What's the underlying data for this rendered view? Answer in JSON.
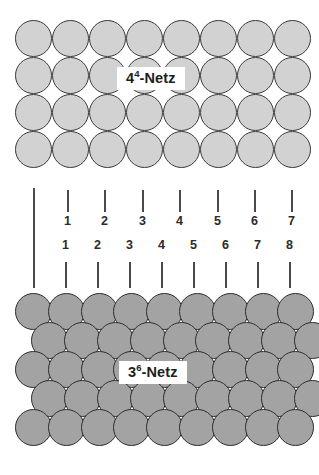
{
  "figure": {
    "background_color": "#ffffff"
  },
  "square_lattice": {
    "name": "4-hoch-4-Netz",
    "label_base": "4",
    "label_exponent": "4",
    "label_suffix": "-Netz",
    "label_full": "4⁴-Netz",
    "sphere_fill_color": "#d2d2d2",
    "sphere_stroke_color": "#3a3a3a",
    "columns": 8,
    "rows": 4,
    "diameter": 37,
    "origin_x": 15,
    "origin_y": 20,
    "step_x": 37,
    "step_y": 37,
    "row_offset": 0
  },
  "hex_lattice": {
    "name": "3-hoch-6-Netz",
    "label_base": "3",
    "label_exponent": "6",
    "label_suffix": "-Netz",
    "label_full": "3⁶-Netz",
    "sphere_fill_color": "#a3a3a3",
    "sphere_stroke_color": "#2e2e2e",
    "columns": 9,
    "rows": 5,
    "diameter": 37,
    "origin_x": 15,
    "origin_y": 293,
    "step_x": 32.8,
    "step_y": 29,
    "row_offset": 16.4
  },
  "ruler_top": {
    "caption": "Periodizitaet des 4-hoch-4-Netzes",
    "origin_x": 33,
    "origin_y": 188,
    "origin_length": 100,
    "tick_y": 190,
    "tick_length": 22,
    "number_y": 214,
    "numbers_below_ticks": true,
    "step_x": 37,
    "ticks": [
      {
        "label": "1",
        "x": 67
      },
      {
        "label": "2",
        "x": 104
      },
      {
        "label": "3",
        "x": 142
      },
      {
        "label": "4",
        "x": 179
      },
      {
        "label": "5",
        "x": 217
      },
      {
        "label": "6",
        "x": 254
      },
      {
        "label": "7",
        "x": 291
      }
    ]
  },
  "ruler_bottom": {
    "caption": "Periodizitaet des 3-hoch-6-Netzes",
    "origin_x": 33,
    "origin_y": 188,
    "origin_length": 100,
    "tick_y": 262,
    "tick_length": 26,
    "number_y": 238,
    "numbers_below_ticks": false,
    "step_x": 32.7,
    "ticks": [
      {
        "label": "1",
        "x": 65
      },
      {
        "label": "2",
        "x": 97
      },
      {
        "label": "3",
        "x": 129
      },
      {
        "label": "4",
        "x": 161
      },
      {
        "label": "5",
        "x": 193
      },
      {
        "label": "6",
        "x": 225
      },
      {
        "label": "7",
        "x": 257
      },
      {
        "label": "8",
        "x": 289
      }
    ]
  }
}
